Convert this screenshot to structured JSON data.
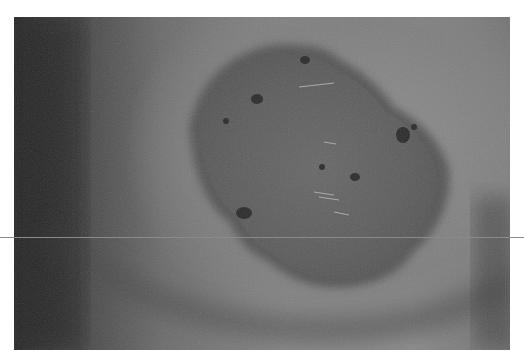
{
  "image": {
    "kind": "photograph",
    "palette": "grayscale",
    "subject_visual": "irregular dark textured lesion on skin surface with curved skin fold below",
    "colors": {
      "background": "#ffffff",
      "skin_light": "#8a8a8a",
      "skin_dark": "#2a2a2a",
      "lesion": "#5e5e5e",
      "spots": "#2b2b2b",
      "guide_line": "#8a8a8a"
    }
  }
}
